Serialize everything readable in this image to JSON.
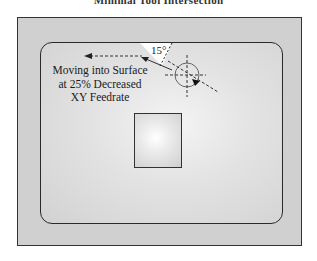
{
  "title": "Minimal Tool Intersection",
  "annotation": {
    "lines": [
      "Moving into Surface",
      "at 25% Decreased",
      "XY Feedrate"
    ]
  },
  "angle_label": "15°",
  "colors": {
    "outer_fill": "#d0d0d0",
    "stroke": "#2a2a2a",
    "wedge": "#ffffff"
  }
}
